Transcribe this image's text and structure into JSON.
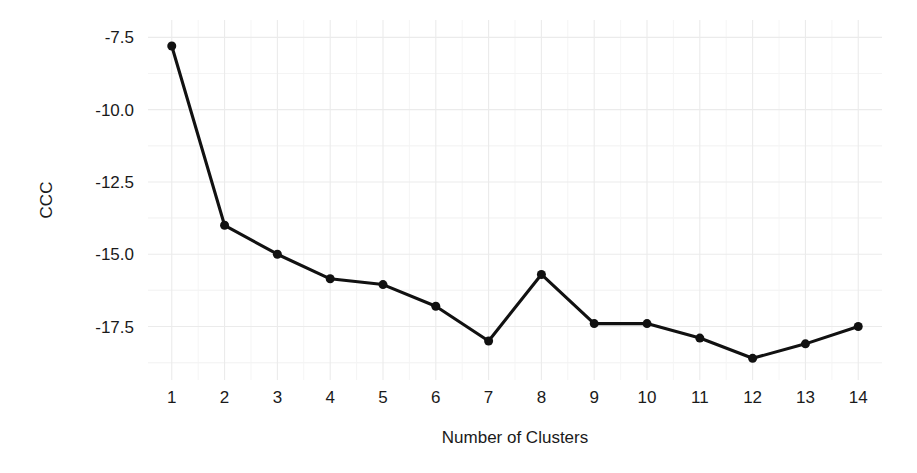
{
  "chart_data": {
    "type": "line",
    "title": "",
    "subtitle": "",
    "xlabel": "Number of Clusters",
    "ylabel": "CCC",
    "x": [
      1,
      2,
      3,
      4,
      5,
      6,
      7,
      8,
      9,
      10,
      11,
      12,
      13,
      14
    ],
    "values": [
      -7.8,
      -14.0,
      -15.0,
      -15.85,
      -16.05,
      -16.8,
      -18.0,
      -15.7,
      -17.4,
      -17.4,
      -17.9,
      -18.6,
      -18.1,
      -17.5
    ],
    "series": [
      {
        "name": "CCC",
        "values": [
          -7.8,
          -14.0,
          -15.0,
          -15.85,
          -16.05,
          -16.8,
          -18.0,
          -15.7,
          -17.4,
          -17.4,
          -17.9,
          -18.6,
          -18.1,
          -17.5
        ]
      }
    ],
    "xtick_labels": [
      "1",
      "2",
      "3",
      "4",
      "5",
      "6",
      "7",
      "8",
      "9",
      "10",
      "11",
      "12",
      "13",
      "14"
    ],
    "ytick_labels": [
      "-7.5",
      "-10.0",
      "-12.5",
      "-15.0",
      "-17.5"
    ],
    "ytick_values": [
      -7.5,
      -10.0,
      -12.5,
      -15.0,
      -17.5
    ],
    "xlim": [
      0.55,
      14.45
    ],
    "ylim": [
      -19.35,
      -6.9
    ],
    "grid": true,
    "grid_minor": true,
    "legend": "none",
    "marker": "circle",
    "marker_size": 9,
    "line_color": "#111111",
    "point_color": "#111111",
    "grid_major_color": "#ebebeb",
    "grid_minor_color": "#f4f4f4",
    "background_color": "#ffffff",
    "text_color": "#1a1a1a"
  }
}
